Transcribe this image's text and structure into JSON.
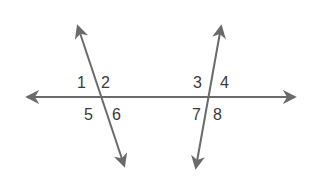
{
  "diagram": {
    "type": "parallel-lines-transversals",
    "line_color": "#6a6a6a",
    "text_color": "#3a3a3a",
    "background": "#ffffff",
    "angle_labels": {
      "a1": "1",
      "a2": "2",
      "a5": "5",
      "a6": "6",
      "a3": "3",
      "a4": "4",
      "a7": "7",
      "a8": "8"
    }
  }
}
